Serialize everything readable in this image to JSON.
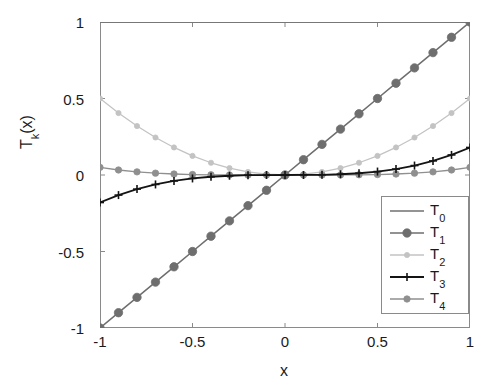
{
  "chart_data": {
    "type": "line",
    "title": "",
    "xlabel": "x",
    "ylabel": "T_k(x)",
    "ylabel_base": "T",
    "ylabel_sub": "k",
    "ylabel_arg": "(x)",
    "xlim": [
      -1,
      1
    ],
    "ylim": [
      -1,
      1
    ],
    "grid": false,
    "legend_position": "lower right",
    "xticks": [
      "-1",
      "-0.5",
      "0",
      "0.5",
      "1"
    ],
    "xtick_values": [
      -1,
      -0.5,
      0,
      0.5,
      1
    ],
    "yticks": [
      "-1",
      "-0.5",
      "0",
      "0.5",
      "1"
    ],
    "ytick_values": [
      -1,
      -0.5,
      0,
      0.5,
      1
    ],
    "x": [
      -1,
      -0.9,
      -0.8,
      -0.7,
      -0.6,
      -0.5,
      -0.4,
      -0.3,
      -0.2,
      -0.1,
      0,
      0.1,
      0.2,
      0.3,
      0.4,
      0.5,
      0.6,
      0.7,
      0.8,
      0.9,
      1
    ],
    "series": [
      {
        "name": "T_0",
        "label_base": "T",
        "label_sub": "0",
        "color": "#707070",
        "marker": "none",
        "marker_size": 0,
        "line_width": 1.4,
        "values": [
          1,
          1,
          1,
          1,
          1,
          1,
          1,
          1,
          1,
          1,
          1,
          1,
          1,
          1,
          1,
          1,
          1,
          1,
          1,
          1,
          1
        ]
      },
      {
        "name": "T_1",
        "label_base": "T",
        "label_sub": "1",
        "color": "#6e6e6e",
        "marker": "circle",
        "marker_size": 4.2,
        "line_width": 1.5,
        "values": [
          -1,
          -0.9,
          -0.8,
          -0.7,
          -0.6,
          -0.5,
          -0.4,
          -0.3,
          -0.2,
          -0.1,
          0,
          0.1,
          0.2,
          0.3,
          0.4,
          0.5,
          0.6,
          0.7,
          0.8,
          0.9,
          1
        ]
      },
      {
        "name": "T_2",
        "label_base": "T",
        "label_sub": "2",
        "color": "#c3c3c3",
        "marker": "circle",
        "marker_size": 2.6,
        "line_width": 1.3,
        "values": [
          0.5,
          0.405,
          0.32,
          0.245,
          0.18,
          0.125,
          0.08,
          0.045,
          0.02,
          0.005,
          0,
          0.005,
          0.02,
          0.045,
          0.08,
          0.125,
          0.18,
          0.245,
          0.32,
          0.405,
          0.5
        ]
      },
      {
        "name": "T_3",
        "label_base": "T",
        "label_sub": "3",
        "color": "#141414",
        "marker": "plus",
        "marker_size": 4.0,
        "line_width": 1.8,
        "values": [
          -0.18,
          -0.1312,
          -0.0922,
          -0.0617,
          -0.0389,
          -0.0225,
          -0.0115,
          -0.0049,
          -0.0014,
          -0.0002,
          0,
          0.0002,
          0.0014,
          0.0049,
          0.0115,
          0.0225,
          0.0389,
          0.0617,
          0.0922,
          0.1312,
          0.18
        ]
      },
      {
        "name": "T_4",
        "label_base": "T",
        "label_sub": "4",
        "color": "#8f8f8f",
        "marker": "circle",
        "marker_size": 3.2,
        "line_width": 1.3,
        "values": [
          0.05,
          0.0328,
          0.0205,
          0.012,
          0.0065,
          0.0031,
          0.0013,
          0.0004,
          0.0001,
          0,
          0,
          0,
          0.0001,
          0.0004,
          0.0013,
          0.0031,
          0.0065,
          0.012,
          0.0205,
          0.0328,
          0.05
        ]
      }
    ]
  },
  "axes": {
    "frame_color": "#8a8a8a",
    "tick_color": "#8a8a8a"
  }
}
